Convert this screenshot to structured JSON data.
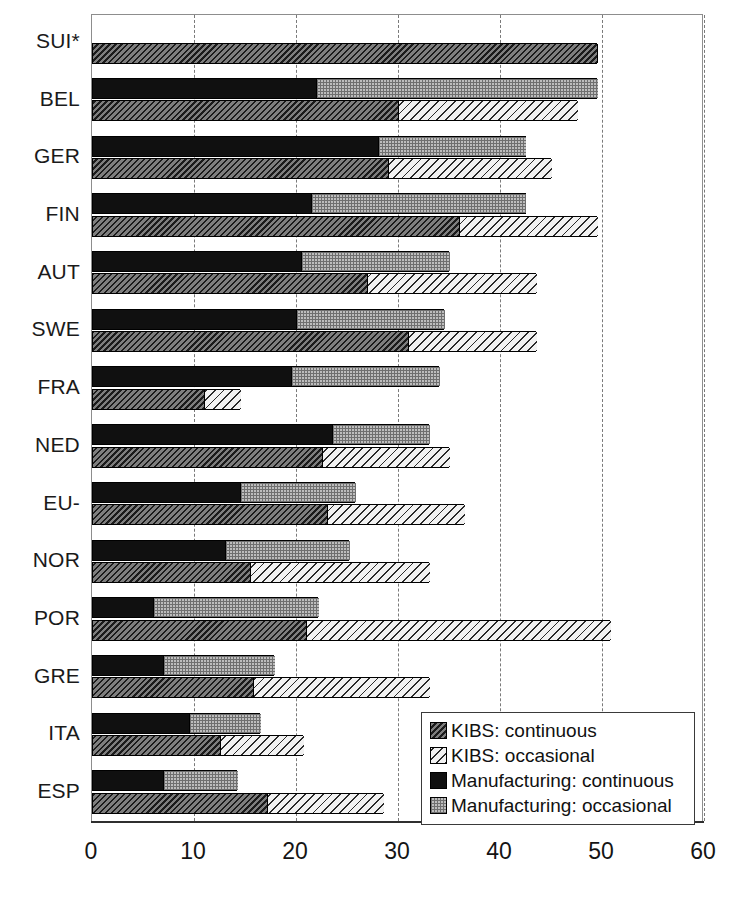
{
  "chart_data": {
    "type": "bar",
    "orientation": "horizontal",
    "title": "",
    "xlabel": "",
    "ylabel": "",
    "xlim": [
      0,
      60
    ],
    "xticks": [
      0,
      10,
      20,
      30,
      40,
      50,
      60
    ],
    "grid": true,
    "grid_axis": "x",
    "legend_position": "bottom-right",
    "stacked": true,
    "categories": [
      "SUI*",
      "BEL",
      "GER",
      "FIN",
      "AUT",
      "SWE",
      "FRA",
      "NED",
      "EU-",
      "NOR",
      "POR",
      "GRE",
      "ITA",
      "ESP"
    ],
    "series": [
      {
        "name": "KIBS: continuous",
        "key": "kibs_cont",
        "values": [
          49.5,
          30.0,
          29.0,
          36.0,
          27.0,
          31.0,
          11.0,
          22.5,
          23.0,
          15.5,
          21.0,
          15.8,
          12.5,
          17.2
        ]
      },
      {
        "name": "KIBS: occasional",
        "key": "kibs_occ",
        "values": [
          null,
          17.5,
          16.0,
          13.5,
          16.5,
          12.5,
          3.5,
          12.5,
          13.5,
          17.5,
          29.8,
          17.2,
          8.2,
          11.3
        ]
      },
      {
        "name": "Manufacturing: continuous",
        "key": "man_cont",
        "values": [
          null,
          22.0,
          28.0,
          21.5,
          20.5,
          20.0,
          19.5,
          23.5,
          14.5,
          13.0,
          6.0,
          7.0,
          9.5,
          7.0
        ]
      },
      {
        "name": "Manufacturing: occasional",
        "key": "man_occ",
        "values": [
          null,
          27.5,
          14.5,
          21.0,
          14.5,
          14.5,
          14.5,
          9.5,
          11.3,
          12.2,
          16.2,
          10.8,
          7.0,
          7.2
        ]
      }
    ],
    "totals": {
      "kibs": [
        49.5,
        47.5,
        45.0,
        49.5,
        43.5,
        43.5,
        14.5,
        35.0,
        36.5,
        33.0,
        50.8,
        33.0,
        20.7,
        28.5
      ],
      "manufacturing": [
        null,
        49.5,
        42.5,
        42.5,
        35.0,
        34.5,
        34.0,
        33.0,
        25.8,
        25.2,
        22.2,
        17.8,
        16.5,
        14.2
      ]
    }
  },
  "legend": {
    "items": [
      {
        "label": "KIBS: continuous",
        "swatch": "kibs-cont-swatch"
      },
      {
        "label": "KIBS: occasional",
        "swatch": "kibs-occ-swatch"
      },
      {
        "label": "Manufacturing: continuous",
        "swatch": "man-cont-swatch"
      },
      {
        "label": "Manufacturing: occasional",
        "swatch": "man-occ-swatch"
      }
    ]
  },
  "axis": {
    "xticks": [
      "0",
      "10",
      "20",
      "30",
      "40",
      "50",
      "60"
    ]
  }
}
